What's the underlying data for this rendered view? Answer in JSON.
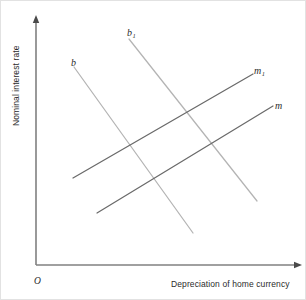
{
  "chart_data": {
    "type": "line",
    "title": "",
    "xlabel": "Depreciation of home currency",
    "ylabel": "Nominal interest rate",
    "origin_label": "O",
    "grid": false,
    "legend": "inline-curve-labels",
    "axis_style": "arrow-headed quadrant axes, no tick marks, no numeric scale",
    "xlim": [
      0,
      1
    ],
    "ylim": [
      0,
      1
    ],
    "series": [
      {
        "name": "b",
        "label": "b",
        "label_sub": "",
        "slope": "negative",
        "color": "#b4b4b4",
        "x": [
          0.142,
          0.592
        ],
        "y": [
          0.797,
          0.129
        ],
        "px": [
          73,
          192
        ],
        "py": [
          66,
          232
        ]
      },
      {
        "name": "b1",
        "label": "b",
        "label_sub": "1",
        "slope": "negative",
        "color": "#b4b4b4",
        "x": [
          0.35,
          0.835
        ],
        "y": [
          0.91,
          0.258
        ],
        "px": [
          128,
          256
        ],
        "py": [
          38,
          200
        ]
      },
      {
        "name": "m1",
        "label": "m",
        "label_sub": "1",
        "slope": "positive",
        "color": "#6a6a6a",
        "x": [
          0.139,
          0.818
        ],
        "y": [
          0.35,
          0.77
        ],
        "px": [
          72,
          252
        ],
        "py": [
          177,
          73
        ]
      },
      {
        "name": "m",
        "label": "m",
        "label_sub": "",
        "slope": "positive",
        "color": "#6a6a6a",
        "x": [
          0.229,
          0.894
        ],
        "y": [
          0.209,
          0.641
        ],
        "px": [
          96,
          272
        ],
        "py": [
          212,
          105
        ]
      }
    ]
  },
  "axes": {
    "x_label": "Depreciation of home currency",
    "y_label": "Nominal interest rate",
    "origin": "O",
    "axis_color": "#808080",
    "x_axis": {
      "x1": 35,
      "y1": 264,
      "x2": 300,
      "y2": 264
    },
    "y_axis": {
      "x1": 35,
      "y1": 264,
      "x2": 35,
      "y2": 16
    }
  },
  "labels": {
    "b": "b",
    "b_one_base": "b",
    "b_one_sub": "1",
    "m": "m",
    "m_one_base": "m",
    "m_one_sub": "1"
  },
  "colors": {
    "background": "#ffffff",
    "border": "#e2e2e2",
    "b_curve": "#b4b4b4",
    "m_curve": "#6a6a6a",
    "axis": "#808080",
    "text": "#2b2b2b"
  }
}
